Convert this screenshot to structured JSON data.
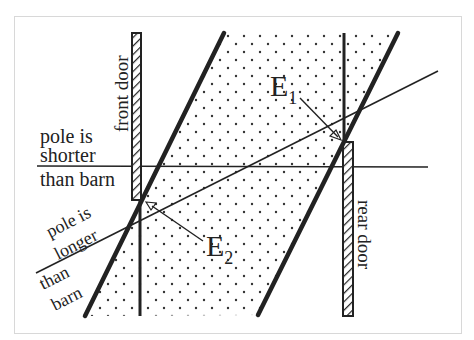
{
  "diagram": {
    "type": "spacetime-diagram",
    "colors": {
      "ink": "#222222",
      "frame": "#d8d8d8",
      "background": "#ffffff",
      "dots": "#333333"
    },
    "labels": {
      "front_door": "front door",
      "rear_door": "rear door",
      "pole_shorter_line1": "pole is",
      "pole_shorter_line2": "shorter",
      "pole_shorter_line3": "than barn",
      "pole_longer_line1": "pole is",
      "pole_longer_line2": "longer",
      "pole_longer_line3": "than",
      "pole_longer_line4": "barn",
      "event1_base": "E",
      "event1_sub": "1",
      "event2_base": "E",
      "event2_sub": "2"
    }
  }
}
